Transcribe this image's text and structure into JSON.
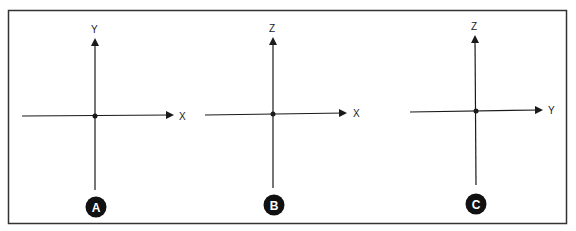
{
  "figure": {
    "panels": [
      {
        "id": "A",
        "vertical_axis": "Y",
        "horizontal_axis": "X"
      },
      {
        "id": "B",
        "vertical_axis": "Z",
        "horizontal_axis": "X"
      },
      {
        "id": "C",
        "vertical_axis": "Z",
        "horizontal_axis": "Y"
      }
    ]
  },
  "colors": {
    "line": "#1a1a1a",
    "border": "#333333",
    "background": "#ffffff",
    "badge": "#111111"
  }
}
